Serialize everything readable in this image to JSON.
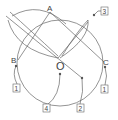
{
  "diagram": {
    "type": "circumcircle-construction",
    "colors": {
      "stroke": "#666666",
      "text": "#444444",
      "background": "#ffffff"
    },
    "points": {
      "A": {
        "label": "A"
      },
      "B": {
        "label": "B"
      },
      "C": {
        "label": "C"
      },
      "O": {
        "label": "O"
      }
    },
    "callouts": [
      {
        "id": "1-left",
        "label": "1"
      },
      {
        "id": "1-right",
        "label": "1"
      },
      {
        "id": "2",
        "label": "2"
      },
      {
        "id": "3",
        "label": "3"
      },
      {
        "id": "4",
        "label": "4"
      }
    ]
  }
}
